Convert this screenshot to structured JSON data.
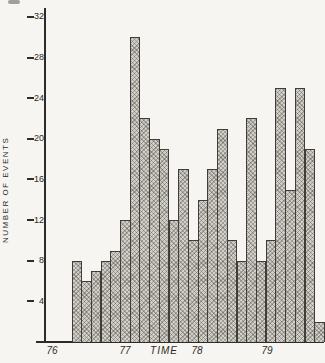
{
  "chart_data": {
    "type": "bar",
    "title": "",
    "ylabel": "NUMBER OF EVENTS",
    "xlabel": "TIME",
    "y_ticks": [
      4,
      8,
      12,
      16,
      20,
      24,
      28,
      32
    ],
    "ylim": [
      0,
      32
    ],
    "x_tick_labels": [
      "76",
      "77",
      "78",
      "79"
    ],
    "grid": "off",
    "legend": "none",
    "bar_fill_color": "#d2cfc8",
    "bar_edge_color": "#403d39",
    "axis_color": "#2e2c28",
    "values": [
      8,
      6,
      7,
      8,
      9,
      12,
      30,
      22,
      20,
      19,
      12,
      17,
      10,
      14,
      17,
      21,
      10,
      8,
      22,
      8,
      10,
      25,
      15,
      25,
      19,
      2
    ]
  }
}
